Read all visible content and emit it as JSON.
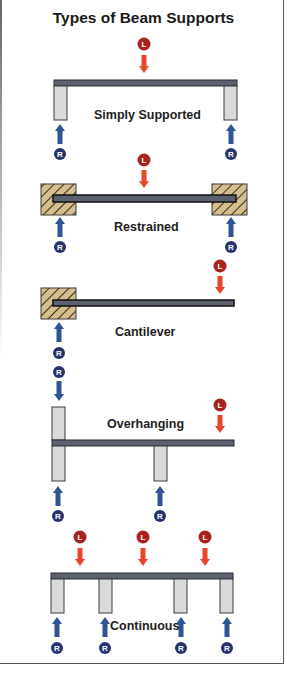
{
  "title": "Types of Beam Supports",
  "colors": {
    "beam": "#5c6170",
    "beam_edge": "#2a2c33",
    "post": "#d9dadb",
    "post_edge": "#3a3a3a",
    "wall": "#d6bf8e",
    "hatch": "#3b2d18",
    "load_arrow": "#e8452a",
    "load_badge": "#a8231c",
    "reaction_arrow": "#2f5597",
    "reaction_badge": "#27336e"
  },
  "badges": {
    "load": "L",
    "reaction": "R"
  },
  "sections": [
    {
      "id": "simply-supported",
      "label": "Simply Supported"
    },
    {
      "id": "restrained",
      "label": "Restrained"
    },
    {
      "id": "cantilever",
      "label": "Cantilever"
    },
    {
      "id": "overhanging",
      "label": "Overhanging"
    },
    {
      "id": "continuous",
      "label": "Continuous"
    }
  ]
}
